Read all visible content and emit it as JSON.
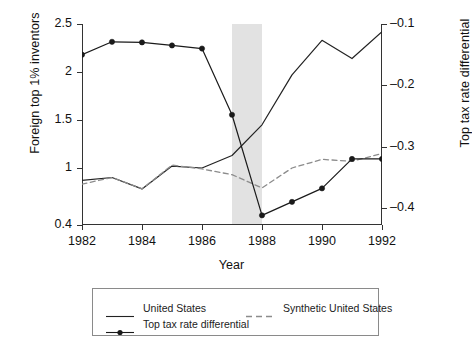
{
  "chart_data": {
    "type": "line",
    "title": "",
    "xlabel": "Year",
    "ylabel": "Foreign top 1% inventors",
    "y2label": "Top tax rate differential",
    "x": [
      1982,
      1983,
      1984,
      1985,
      1986,
      1987,
      1988,
      1989,
      1990,
      1991,
      1992
    ],
    "xlim": [
      1982,
      1992
    ],
    "xticks": [
      "1982",
      "1984",
      "1986",
      "1988",
      "1990",
      "1992"
    ],
    "xtick_values": [
      1982,
      1984,
      1986,
      1988,
      1990,
      1992
    ],
    "yticks": [
      "0.4",
      "1",
      "1.5",
      "2",
      "2.5"
    ],
    "ytick_values": [
      0.4,
      1,
      1.5,
      2,
      2.5
    ],
    "ylim": [
      0.4,
      2.5
    ],
    "y2ticks": [
      "-0.1",
      "-0.2",
      "-0.3",
      "-0.4"
    ],
    "y2tick_values": [
      -0.1,
      -0.2,
      -0.3,
      -0.4
    ],
    "y2lim": [
      -0.44,
      -0.06
    ],
    "grid": false,
    "legend_position": "bottom",
    "shaded_region": {
      "x_start": 1987,
      "x_end": 1988,
      "color": "#e2e2e2"
    },
    "series": [
      {
        "name": "United States",
        "axis": "left",
        "style": "solid",
        "color": "#222222",
        "markers": false,
        "values": [
          0.87,
          0.9,
          0.78,
          1.02,
          1.0,
          1.13,
          1.45,
          1.97,
          2.33,
          2.14,
          2.42
        ]
      },
      {
        "name": "Synthetic United States",
        "axis": "left",
        "style": "dashed",
        "color": "#8c8c8c",
        "markers": false,
        "values": [
          0.83,
          0.9,
          0.78,
          1.03,
          0.99,
          0.93,
          0.79,
          1.0,
          1.09,
          1.07,
          1.15
        ]
      },
      {
        "name": "Top tax rate differential",
        "axis": "right",
        "style": "solid-markers",
        "color": "#1a1a1a",
        "markers": true,
        "values": [
          -0.15,
          -0.129,
          -0.13,
          -0.135,
          -0.14,
          -0.248,
          -0.412,
          -0.39,
          -0.368,
          -0.32,
          -0.32
        ]
      }
    ]
  },
  "legend": {
    "items": [
      {
        "label": "United States",
        "key": "solid-line"
      },
      {
        "label": "Synthetic United States",
        "key": "dashed-line"
      },
      {
        "label": "Top tax rate differential",
        "key": "marker-line"
      }
    ]
  }
}
